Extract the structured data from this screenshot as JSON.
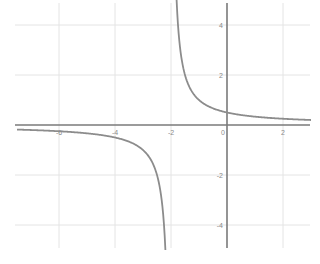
{
  "chart_data": {
    "type": "line",
    "title": "",
    "xlabel": "",
    "ylabel": "",
    "function": "y = 1/(x+2)",
    "xlim": [
      -7.5,
      3
    ],
    "ylim": [
      -5,
      5
    ],
    "grid": true,
    "x_ticks": [
      -6,
      -4,
      -2,
      0,
      2
    ],
    "y_ticks": [
      4,
      2,
      -2,
      -4
    ],
    "x_tick_labels": [
      "-6",
      "-4",
      "-2",
      "0",
      "2"
    ],
    "y_tick_labels": [
      "4",
      "2",
      "-2",
      "-4"
    ],
    "vertical_asymptote": -2,
    "horizontal_asymptote": 0,
    "series": [
      {
        "name": "left branch",
        "x": [
          -7.5,
          -6,
          -5,
          -4,
          -3,
          -2.5,
          -2.3,
          -2.2
        ],
        "y": [
          -0.18,
          -0.25,
          -0.33,
          -0.5,
          -1,
          -2,
          -3.33,
          -5
        ]
      },
      {
        "name": "right branch",
        "x": [
          -1.8,
          -1.7,
          -1.5,
          -1,
          0,
          1,
          2,
          3
        ],
        "y": [
          5,
          3.33,
          2,
          1,
          0.5,
          0.33,
          0.25,
          0.2
        ]
      }
    ],
    "colors": {
      "curve": "#8c8c8c",
      "axis": "#7a7a7a",
      "grid": "#e4e4e4",
      "tick": "#8a8a8a"
    }
  }
}
